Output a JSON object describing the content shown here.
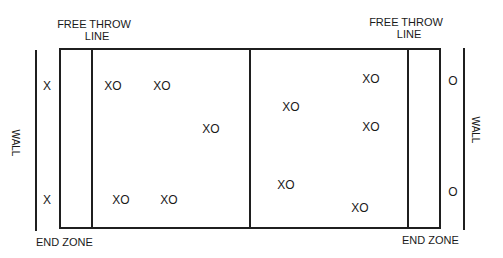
{
  "labels": {
    "free_throw_left": [
      "FREE THROW",
      "LINE"
    ],
    "free_throw_right": [
      "FREE THROW",
      "LINE"
    ],
    "end_zone_left": "END ZONE",
    "end_zone_right": "END ZONE",
    "wall_left": "WALL",
    "wall_right": "WALL"
  },
  "players": [
    {
      "text": "X",
      "x": 47,
      "y": 86
    },
    {
      "text": "XO",
      "x": 113,
      "y": 86
    },
    {
      "text": "XO",
      "x": 162,
      "y": 86
    },
    {
      "text": "XO",
      "x": 211,
      "y": 129
    },
    {
      "text": "X",
      "x": 47,
      "y": 200
    },
    {
      "text": "XO",
      "x": 121,
      "y": 200
    },
    {
      "text": "XO",
      "x": 169,
      "y": 200
    },
    {
      "text": "XO",
      "x": 371,
      "y": 79
    },
    {
      "text": "XO",
      "x": 291,
      "y": 107
    },
    {
      "text": "XO",
      "x": 371,
      "y": 127
    },
    {
      "text": "XO",
      "x": 286,
      "y": 185
    },
    {
      "text": "XO",
      "x": 360,
      "y": 208
    },
    {
      "text": "O",
      "x": 453,
      "y": 81
    },
    {
      "text": "O",
      "x": 453,
      "y": 192
    }
  ]
}
